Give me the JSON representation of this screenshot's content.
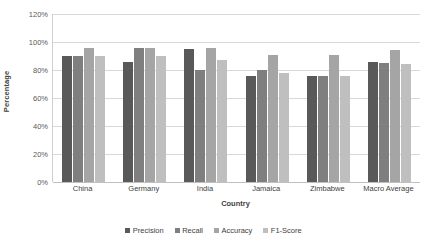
{
  "chart_data": {
    "type": "bar",
    "title": "",
    "xlabel": "Country",
    "ylabel": "Percentage",
    "categories": [
      "China",
      "Germany",
      "India",
      "Jamaica",
      "Zimbabwe",
      "Macro Average"
    ],
    "series": [
      {
        "name": "Precision",
        "color": "#595959",
        "values": [
          90,
          86,
          95,
          76,
          76,
          86
        ]
      },
      {
        "name": "Recall",
        "color": "#7f7f7f",
        "values": [
          90,
          96,
          80,
          80,
          76,
          85
        ]
      },
      {
        "name": "Accuracy",
        "color": "#a5a5a5",
        "values": [
          96,
          96,
          96,
          91,
          91,
          94
        ]
      },
      {
        "name": "F1-Score",
        "color": "#bfbfbf",
        "values": [
          90,
          90,
          87,
          78,
          76,
          84
        ]
      }
    ],
    "ylim": [
      0,
      120
    ],
    "y_ticks": [
      "0%",
      "20%",
      "40%",
      "60%",
      "80%",
      "100%",
      "120%"
    ],
    "y_tick_values": [
      0,
      20,
      40,
      60,
      80,
      100,
      120
    ],
    "grid": true,
    "legend_position": "bottom"
  }
}
